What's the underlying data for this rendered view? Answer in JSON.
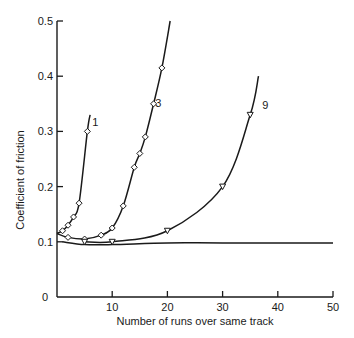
{
  "chart_data": {
    "type": "line",
    "title": "",
    "xlabel": "Number of runs over same track",
    "ylabel": "Coefficient of friction",
    "xlim": [
      0,
      50
    ],
    "ylim": [
      0,
      0.5
    ],
    "xticks": [
      "10",
      "20",
      "30",
      "40",
      "50"
    ],
    "yticks": [
      "0",
      "0.1",
      "0.2",
      "0.3",
      "0.4",
      "0.5"
    ],
    "origin_label": "0",
    "grid": false,
    "legend_title": "Number of films",
    "series": [
      {
        "name": "1",
        "marker": "diamond",
        "points": [
          [
            0,
            0.115
          ],
          [
            1,
            0.12
          ],
          [
            2,
            0.13
          ],
          [
            3,
            0.145
          ],
          [
            4,
            0.17
          ],
          [
            5.5,
            0.3
          ]
        ],
        "curve_end": [
          6,
          0.33
        ]
      },
      {
        "name": "3",
        "marker": "diamond",
        "points": [
          [
            0,
            0.115
          ],
          [
            2,
            0.108
          ],
          [
            5,
            0.105
          ],
          [
            8,
            0.112
          ],
          [
            10,
            0.125
          ],
          [
            12,
            0.165
          ],
          [
            14,
            0.235
          ],
          [
            15,
            0.26
          ],
          [
            16,
            0.29
          ],
          [
            17.5,
            0.35
          ],
          [
            19,
            0.415
          ]
        ],
        "curve_end": [
          20.5,
          0.5
        ]
      },
      {
        "name": "9",
        "marker": "inverted-triangle",
        "points": [
          [
            5,
            0.1
          ],
          [
            10,
            0.1
          ],
          [
            20,
            0.12
          ],
          [
            30,
            0.2
          ],
          [
            35,
            0.33
          ]
        ],
        "curve_end": [
          36.5,
          0.4
        ]
      },
      {
        "name": "53",
        "marker": "triangle",
        "points": [
          [
            1,
            0.1
          ],
          [
            5,
            0.095
          ],
          [
            10,
            0.095
          ],
          [
            20,
            0.098
          ],
          [
            30,
            0.098
          ],
          [
            50,
            0.098
          ]
        ]
      }
    ]
  }
}
